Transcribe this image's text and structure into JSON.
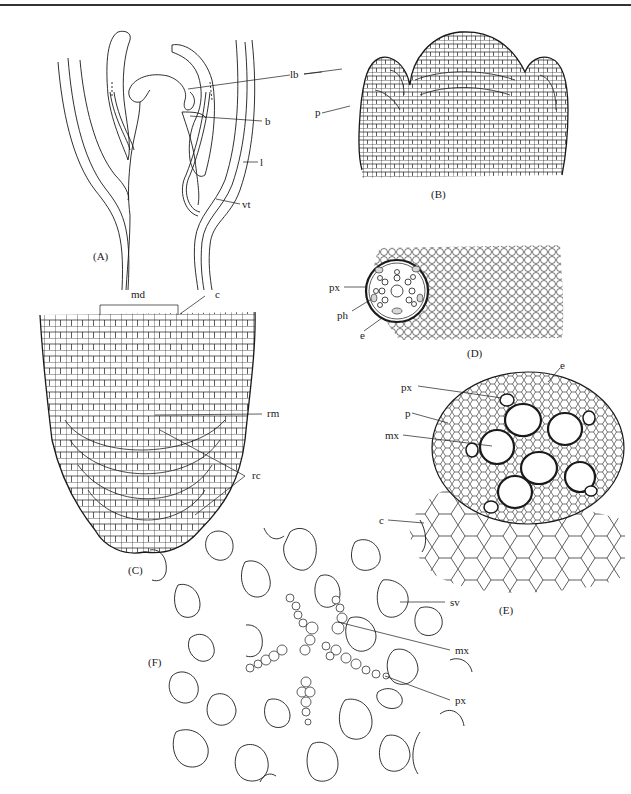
{
  "figure": {
    "panels": [
      {
        "id": "A",
        "caption": "(A)",
        "subject": "shoot apex longitudinal outline",
        "labels": [
          {
            "text": "lb",
            "meaning": "leaf base / leaf primordium"
          },
          {
            "text": "b",
            "meaning": "bud"
          },
          {
            "text": "l",
            "meaning": "leaf"
          },
          {
            "text": "vt",
            "meaning": "vascular tissue"
          }
        ]
      },
      {
        "id": "B",
        "caption": "(B)",
        "subject": "shoot apical meristem cellular detail",
        "labels": [
          {
            "text": "p",
            "meaning": "primordium"
          }
        ]
      },
      {
        "id": "C",
        "caption": "(C)",
        "subject": "root apex longitudinal section",
        "labels": [
          {
            "text": "md",
            "meaning": "meristematic domain"
          },
          {
            "text": "c",
            "meaning": "cortex"
          },
          {
            "text": "rm",
            "meaning": "root meristem"
          },
          {
            "text": "rc",
            "meaning": "root cap"
          }
        ]
      },
      {
        "id": "D",
        "caption": "(D)",
        "subject": "root transverse section overview",
        "labels": [
          {
            "text": "px",
            "meaning": "protoxylem"
          },
          {
            "text": "ph",
            "meaning": "phloem"
          },
          {
            "text": "e",
            "meaning": "endodermis"
          }
        ]
      },
      {
        "id": "E",
        "caption": "(E)",
        "subject": "stele transverse section detail",
        "labels": [
          {
            "text": "e",
            "meaning": "endodermis"
          },
          {
            "text": "px",
            "meaning": "protoxylem"
          },
          {
            "text": "p",
            "meaning": "pericycle"
          },
          {
            "text": "mx",
            "meaning": "metaxylem"
          },
          {
            "text": "c",
            "meaning": "cortex"
          }
        ]
      },
      {
        "id": "F",
        "caption": "(F)",
        "subject": "polyarch stele with sieve vessels",
        "labels": [
          {
            "text": "sv",
            "meaning": "sieve element / vessel"
          },
          {
            "text": "mx",
            "meaning": "metaxylem"
          },
          {
            "text": "px",
            "meaning": "protoxylem"
          }
        ]
      }
    ]
  },
  "colors": {
    "ink": "#1a1a1a",
    "background": "#ffffff",
    "rule": "#333333"
  }
}
